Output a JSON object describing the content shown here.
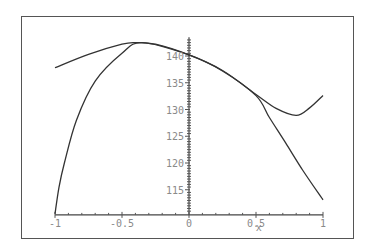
{
  "chart_data": {
    "type": "line",
    "title": "",
    "xlabel": "x",
    "ylabel": "",
    "xlim": [
      -1,
      1
    ],
    "ylim": [
      110.3,
      143.5
    ],
    "grid": false,
    "legend": null,
    "x_ticks": [
      {
        "value": -1,
        "label": "-1"
      },
      {
        "value": -0.5,
        "label": "-0.5"
      },
      {
        "value": 0,
        "label": "0"
      },
      {
        "value": 0.5,
        "label": "0.5"
      },
      {
        "value": 1,
        "label": "1"
      }
    ],
    "y_ticks": [
      {
        "value": 115,
        "label": "115"
      },
      {
        "value": 120,
        "label": "120"
      },
      {
        "value": 125,
        "label": "125"
      },
      {
        "value": 130,
        "label": "130"
      },
      {
        "value": 135,
        "label": "135"
      },
      {
        "value": 140,
        "label": "140"
      }
    ],
    "series": [
      {
        "name": "curve-1",
        "x": [
          -1,
          -0.75,
          -0.5,
          -0.4,
          -0.25,
          0,
          0.25,
          0.5,
          0.65,
          0.8,
          0.9,
          1
        ],
        "y": [
          137.8,
          140.3,
          142.2,
          142.5,
          142.2,
          140.2,
          137.3,
          132.8,
          130.2,
          128.9,
          130.3,
          132.6
        ]
      },
      {
        "name": "curve-2",
        "x": [
          -1,
          -0.97,
          -0.93,
          -0.84,
          -0.7,
          -0.5,
          -0.35,
          0,
          0.25,
          0.5,
          0.6,
          0.72,
          0.85,
          1
        ],
        "y": [
          110.5,
          115.5,
          120,
          128,
          135.3,
          140.5,
          142.5,
          140.2,
          137.2,
          132.6,
          128.5,
          123.8,
          118.6,
          113.1
        ]
      }
    ]
  },
  "colors": {
    "frame": "#555555",
    "curve": "#333333",
    "tick_label": "#8a8a8a"
  }
}
